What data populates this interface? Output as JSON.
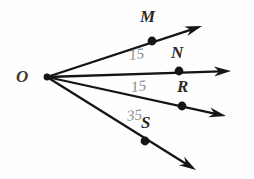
{
  "figure": {
    "background_color": "#fefefe",
    "ink_color": "#151515",
    "label_color": "#2b2b2b",
    "annotation_color": "#8e8e8e",
    "vertex": {
      "name": "vertex-o",
      "label": "O",
      "x": 47,
      "y": 77,
      "label_x": 16,
      "label_y": 68
    },
    "rays": [
      {
        "name": "ray-om",
        "label": "M",
        "point_label": "M",
        "point_x": 152,
        "point_y": 41,
        "label_x": 140,
        "label_y": 8,
        "tip_x": 202,
        "tip_y": 26
      },
      {
        "name": "ray-on",
        "label": "N",
        "point_label": "N",
        "point_x": 179,
        "point_y": 71,
        "label_x": 171,
        "label_y": 44,
        "tip_x": 231,
        "tip_y": 71
      },
      {
        "name": "ray-or",
        "label": "R",
        "point_label": "R",
        "point_x": 182,
        "point_y": 106,
        "label_x": 177,
        "label_y": 78,
        "tip_x": 226,
        "tip_y": 116
      },
      {
        "name": "ray-os",
        "label": "S",
        "point_label": "S",
        "point_x": 145,
        "point_y": 141,
        "label_x": 141,
        "label_y": 114,
        "tip_x": 196,
        "tip_y": 170
      }
    ],
    "annotations": [
      {
        "name": "angle-measure-mon",
        "text": "15",
        "x": 129,
        "y": 47,
        "rotation": -8
      },
      {
        "name": "angle-measure-nor",
        "text": "15",
        "x": 131,
        "y": 79,
        "rotation": -8
      },
      {
        "name": "angle-measure-ros",
        "text": "35",
        "x": 127,
        "y": 108,
        "rotation": -6
      }
    ]
  }
}
